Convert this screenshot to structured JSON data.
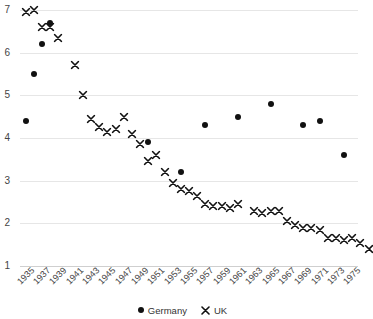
{
  "chart_data": {
    "type": "scatter",
    "title": "",
    "subtitle": "",
    "xlabel": "",
    "ylabel": "",
    "xlim": [
      1934.3,
      1975.7
    ],
    "ylim": [
      1,
      7
    ],
    "grid": true,
    "legend_position": "bottom-center",
    "y_ticks": [
      7,
      6,
      5,
      4,
      3,
      2,
      1
    ],
    "x_ticks": [
      1935,
      1937,
      1939,
      1941,
      1943,
      1945,
      1947,
      1949,
      1951,
      1953,
      1955,
      1957,
      1959,
      1961,
      1963,
      1965,
      1967,
      1969,
      1971,
      1973,
      1975
    ],
    "series": [
      {
        "name": "Germany",
        "marker": "dot",
        "color": "#111111",
        "points": [
          {
            "x": 1935,
            "y": 4.4
          },
          {
            "x": 1936,
            "y": 5.5
          },
          {
            "x": 1937,
            "y": 6.2
          },
          {
            "x": 1938,
            "y": 6.7
          },
          {
            "x": 1950,
            "y": 3.9
          },
          {
            "x": 1954,
            "y": 3.2
          },
          {
            "x": 1957,
            "y": 4.3
          },
          {
            "x": 1961,
            "y": 4.5
          },
          {
            "x": 1965,
            "y": 4.8
          },
          {
            "x": 1969,
            "y": 4.3
          },
          {
            "x": 1971,
            "y": 4.4
          },
          {
            "x": 1974,
            "y": 3.6
          }
        ]
      },
      {
        "name": "UK",
        "marker": "x",
        "color": "#111111",
        "points": [
          {
            "x": 1935,
            "y": 6.95
          },
          {
            "x": 1936,
            "y": 7.0
          },
          {
            "x": 1937,
            "y": 6.6
          },
          {
            "x": 1938,
            "y": 6.6
          },
          {
            "x": 1939,
            "y": 6.35
          },
          {
            "x": 1941,
            "y": 5.7
          },
          {
            "x": 1942,
            "y": 5.0
          },
          {
            "x": 1943,
            "y": 4.45
          },
          {
            "x": 1944,
            "y": 4.25
          },
          {
            "x": 1945,
            "y": 4.15
          },
          {
            "x": 1946,
            "y": 4.2
          },
          {
            "x": 1947,
            "y": 4.5
          },
          {
            "x": 1948,
            "y": 4.1
          },
          {
            "x": 1949,
            "y": 3.85
          },
          {
            "x": 1950,
            "y": 3.45
          },
          {
            "x": 1951,
            "y": 3.6
          },
          {
            "x": 1952,
            "y": 3.2
          },
          {
            "x": 1953,
            "y": 2.95
          },
          {
            "x": 1954,
            "y": 2.8
          },
          {
            "x": 1955,
            "y": 2.75
          },
          {
            "x": 1956,
            "y": 2.65
          },
          {
            "x": 1957,
            "y": 2.45
          },
          {
            "x": 1958,
            "y": 2.4
          },
          {
            "x": 1959,
            "y": 2.4
          },
          {
            "x": 1960,
            "y": 2.35
          },
          {
            "x": 1961,
            "y": 2.45
          },
          {
            "x": 1963,
            "y": 2.3
          },
          {
            "x": 1964,
            "y": 2.25
          },
          {
            "x": 1965,
            "y": 2.3
          },
          {
            "x": 1966,
            "y": 2.3
          },
          {
            "x": 1967,
            "y": 2.05
          },
          {
            "x": 1968,
            "y": 1.95
          },
          {
            "x": 1969,
            "y": 1.9
          },
          {
            "x": 1970,
            "y": 1.9
          },
          {
            "x": 1971,
            "y": 1.85
          },
          {
            "x": 1972,
            "y": 1.65
          },
          {
            "x": 1973,
            "y": 1.65
          },
          {
            "x": 1974,
            "y": 1.6
          },
          {
            "x": 1975,
            "y": 1.65
          },
          {
            "x": 1976,
            "y": 1.55
          },
          {
            "x": 1977,
            "y": 1.4
          }
        ]
      }
    ],
    "legend": [
      {
        "label": "Germany",
        "marker": "dot"
      },
      {
        "label": "UK",
        "marker": "x"
      }
    ]
  }
}
